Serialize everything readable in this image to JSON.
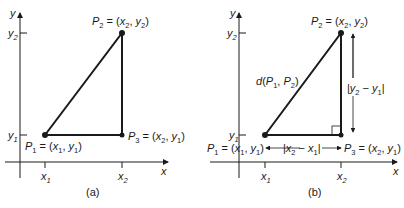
{
  "figure": {
    "panels": [
      {
        "caption": "(a)",
        "axes": {
          "x_label": "x",
          "y_label": "y"
        },
        "ticks": {
          "x": [
            "x1",
            "x2"
          ],
          "y": [
            "y1",
            "y2"
          ]
        },
        "points": {
          "P1": "P1 = (x1, y1)",
          "P2": "P2 = (x2, y2)",
          "P3": "P3 = (x2, y1)"
        }
      },
      {
        "caption": "(b)",
        "axes": {
          "x_label": "x",
          "y_label": "y"
        },
        "ticks": {
          "x": [
            "x1",
            "x2"
          ],
          "y": [
            "y1",
            "y2"
          ]
        },
        "points": {
          "P1": "P1 = (x1, y1)",
          "P2": "P2 = (x2, y2)",
          "P3": "P3 = (x2, y1)"
        },
        "annotations": {
          "hypotenuse": "d(P1, P2)",
          "vertical": "|y2 − y1|",
          "horizontal": "|x2 − x1|"
        }
      }
    ]
  },
  "captions": {
    "a": "(a)",
    "b": "(b)"
  },
  "colors": {
    "line": "#1a1a1a",
    "background": "#ffffff"
  }
}
